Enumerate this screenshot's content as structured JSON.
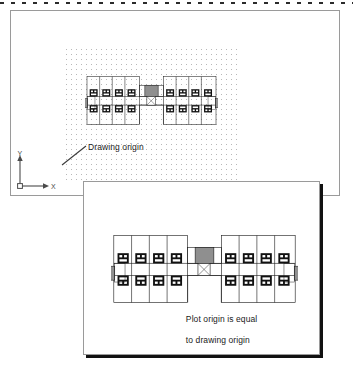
{
  "figure": {
    "type": "cad-plot-origin-illustration",
    "top_rule": "dashed-separator"
  },
  "model_space": {
    "name": "model-space-sheet",
    "grid": "dotted-grid",
    "ucs_icon": {
      "x_label": "X",
      "y_label": "Y",
      "origin_marker": "square"
    },
    "annotation": {
      "label": "Drawing origin",
      "leader": "line-to-origin"
    },
    "drawing": {
      "name": "apartment-building-floor-plan",
      "units": 6
    }
  },
  "plot_space": {
    "name": "plot-preview-sheet",
    "annotation": {
      "line1": "Plot origin is equal",
      "line2": "to drawing origin",
      "leader": "line-to-sheet-corner"
    },
    "drawing": {
      "name": "apartment-building-floor-plan",
      "units": 6
    }
  },
  "colors": {
    "sheet_border": "#9a9a9a",
    "shadow": "#111111",
    "grid_dot": "#b8b8b8",
    "ink": "#1a1a1a",
    "wall_fill": "#111111",
    "hatch_fill": "#8f8f8f",
    "dash_rule": "#2b2b2b"
  }
}
